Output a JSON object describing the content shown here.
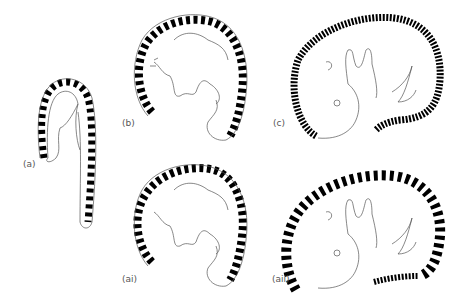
{
  "figure": {
    "panels": [
      {
        "id": "a",
        "label": "(a)"
      },
      {
        "id": "b",
        "label": "(b)"
      },
      {
        "id": "c",
        "label": "(c)"
      },
      {
        "id": "ai",
        "label": "(ai)"
      },
      {
        "id": "aii",
        "label": "(aii)"
      }
    ],
    "colors": {
      "background": "#ffffff",
      "bands": "#000000",
      "outline": "#555555",
      "label": "#555555"
    }
  }
}
